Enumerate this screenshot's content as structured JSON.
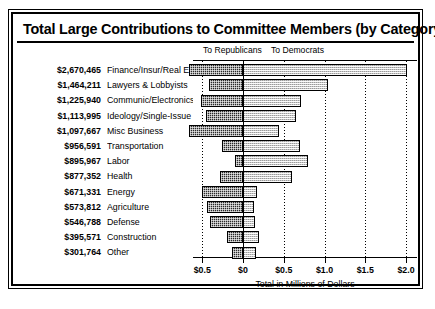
{
  "chart": {
    "title": "Total Large Contributions to Committee Members (by Category)",
    "legend": {
      "left": "To Republicans",
      "right": "To Democrats"
    },
    "axis_title": "Total in Millions of Dollars"
  },
  "chart_data": {
    "type": "bar",
    "orientation": "horizontal",
    "subtype": "diverging",
    "title": "Total Large Contributions to Committee Members (by Category)",
    "xlabel": "Total in Millions of Dollars",
    "ylabel": "",
    "grid": true,
    "legend_position": "top",
    "xlim": [
      -0.85,
      2.1
    ],
    "xticks": [
      -0.5,
      0,
      0.5,
      1.0,
      1.5,
      2.0
    ],
    "xticklabels": [
      "$0.5",
      "$0",
      "$0.5",
      "$1.0",
      "$1.5",
      "$2.0"
    ],
    "units": "millions of dollars",
    "categories": [
      "Finance/Insur/Real Est",
      "Lawyers & Lobbyists",
      "Communic/Electronics",
      "Ideology/Single-Issue",
      "Misc Business",
      "Transportation",
      "Labor",
      "Health",
      "Energy",
      "Agriculture",
      "Defense",
      "Construction",
      "Other"
    ],
    "totals_label": [
      "$2,670,465",
      "$1,464,211",
      "$1,225,940",
      "$1,113,995",
      "$1,097,667",
      "$956,591",
      "$895,967",
      "$877,352",
      "$671,331",
      "$573,812",
      "$546,788",
      "$395,571",
      "$301,764"
    ],
    "totals": [
      2670465,
      1464211,
      1225940,
      1113995,
      1097667,
      956591,
      895967,
      877352,
      671331,
      573812,
      546788,
      395571,
      301764
    ],
    "series": [
      {
        "name": "To Republicans",
        "direction": "left",
        "values": [
          0.66,
          0.42,
          0.52,
          0.46,
          0.66,
          0.26,
          0.1,
          0.28,
          0.5,
          0.44,
          0.4,
          0.2,
          0.14
        ]
      },
      {
        "name": "To Democrats",
        "direction": "right",
        "values": [
          2.01,
          1.04,
          0.71,
          0.65,
          0.44,
          0.7,
          0.8,
          0.6,
          0.17,
          0.13,
          0.15,
          0.2,
          0.16
        ]
      }
    ]
  }
}
